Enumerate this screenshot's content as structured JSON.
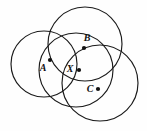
{
  "figure": {
    "name": "four-overlapping-circles-diagram",
    "width": 147,
    "height": 131,
    "background_color": "#fefefe",
    "stroke_color": "#1a1a1a",
    "dot_color": "#111111",
    "circles": [
      {
        "id": "circle-left",
        "cx": 44,
        "cy": 64,
        "r": 33
      },
      {
        "id": "circle-top",
        "cx": 85,
        "cy": 44,
        "r": 37
      },
      {
        "id": "circle-center",
        "cx": 76,
        "cy": 70,
        "r": 37
      },
      {
        "id": "circle-bottom-right",
        "cx": 100,
        "cy": 83,
        "r": 38
      }
    ],
    "points": [
      {
        "id": "point-A",
        "label": "A",
        "dot_x": 50,
        "dot_y": 60,
        "label_x": 43,
        "label_y": 69
      },
      {
        "id": "point-B",
        "label": "B",
        "dot_x": 84,
        "dot_y": 48,
        "label_x": 87,
        "label_y": 39
      },
      {
        "id": "point-X",
        "label": "X",
        "dot_x": 79,
        "dot_y": 70,
        "label_x": 70,
        "label_y": 70
      },
      {
        "id": "point-C",
        "label": "C",
        "dot_x": 98,
        "dot_y": 89,
        "label_x": 90,
        "label_y": 90
      }
    ],
    "dot_radius": 2.1
  }
}
